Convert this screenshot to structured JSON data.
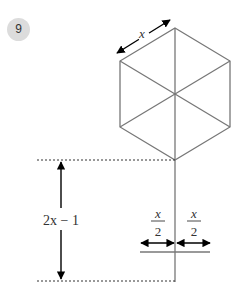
{
  "question_number": "9",
  "diagram": {
    "shape": "regular hexagon divided into 6 triangles",
    "side_label": "x",
    "height_label": "2x − 1",
    "half_width_left_label": {
      "numerator": "x",
      "denominator": "2"
    },
    "half_width_right_label": {
      "numerator": "x",
      "denominator": "2"
    },
    "colors": {
      "lines": "#777777",
      "arrows": "#000000",
      "badge_bg": "#dcdcdc"
    }
  }
}
